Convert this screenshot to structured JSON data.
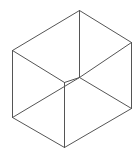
{
  "figure": {
    "type": "wireframe-cube",
    "background": "#ffffff",
    "stroke": "#555555",
    "stroke_width": 1,
    "vertices": {
      "top": [
        79,
        10
      ],
      "top_left": [
        12,
        50
      ],
      "top_right": [
        131,
        42
      ],
      "front": [
        64,
        82
      ],
      "inner": [
        79,
        77
      ],
      "bottom_left": [
        12,
        117
      ],
      "bottom_right": [
        131,
        108
      ],
      "bottom": [
        64,
        147
      ]
    },
    "edges": [
      [
        "top",
        "top_left"
      ],
      [
        "top",
        "top_right"
      ],
      [
        "top",
        "inner"
      ],
      [
        "top_left",
        "front"
      ],
      [
        "top_right",
        "inner"
      ],
      [
        "top_left",
        "bottom_left"
      ],
      [
        "top_right",
        "bottom_right"
      ],
      [
        "front",
        "bottom"
      ],
      [
        "bottom_left",
        "inner"
      ],
      [
        "inner",
        "bottom_right"
      ],
      [
        "bottom_left",
        "bottom"
      ],
      [
        "bottom",
        "bottom_right"
      ],
      [
        "front",
        "inner"
      ]
    ]
  }
}
